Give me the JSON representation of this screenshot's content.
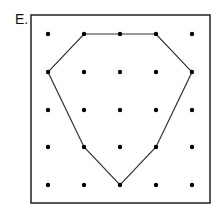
{
  "figure": {
    "label": "E.",
    "frame": {
      "x": 31,
      "y": 15,
      "width": 179,
      "height": 188
    },
    "grid": {
      "cols": [
        48,
        84,
        120,
        156,
        192
      ],
      "rows": [
        34,
        72,
        110,
        147,
        185
      ]
    },
    "polygon": {
      "vertices_grid": [
        [
          1,
          0
        ],
        [
          3,
          0
        ],
        [
          4,
          1
        ],
        [
          3,
          3
        ],
        [
          2,
          4
        ],
        [
          1,
          3
        ],
        [
          0,
          1
        ]
      ],
      "stroke": "#333333"
    },
    "dot_color": "#000000"
  }
}
